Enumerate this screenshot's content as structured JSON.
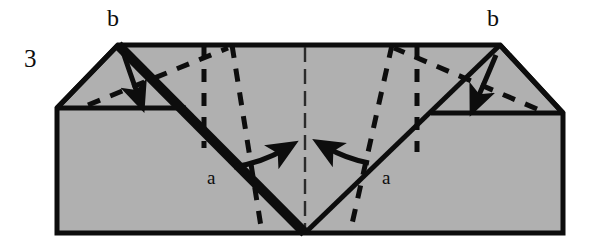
{
  "figure": {
    "name": "beveled-block-fold-diagram",
    "index_label": "3",
    "background_color": "#ffffff",
    "body_fill_color": "#b0b0b0",
    "outline_color": "#0d0d0d",
    "labels": [
      {
        "id": "index",
        "text": "3",
        "x": 24,
        "y": 46
      },
      {
        "id": "b-left",
        "text": "b",
        "x": 107,
        "y": 6
      },
      {
        "id": "b-right",
        "text": "b",
        "x": 487,
        "y": 6
      },
      {
        "id": "a-left",
        "text": "a",
        "x": 207,
        "y": 168
      },
      {
        "id": "a-right",
        "text": "a",
        "x": 382,
        "y": 168
      }
    ],
    "geometry": {
      "outline_points": "57,233 57,108 118,45 500,45 563,113 563,233",
      "body_top_left": "57,108",
      "body_top_right": "563,113",
      "apex_left": "118,45",
      "apex_right": "500,45",
      "valley_bottom": "305,233",
      "left_bevel_edge": "57,108 118,45",
      "right_bevel_edge": "500,45 563,113",
      "left_facet_base": "57,108 185,108",
      "right_facet_base": "432,113 563,113",
      "heavy_fold_left": "118,45 305,233",
      "fold_right": "500,45 305,233",
      "center_axis": "305,45 305,233"
    },
    "strokes": {
      "outline_width": 5,
      "heavy_fold_width": 9,
      "fold_width": 5,
      "dash_width": 5,
      "arrow_width": 5,
      "dash_pattern": "13 11"
    },
    "elements": [
      {
        "id": "block-outline",
        "type": "polygon"
      },
      {
        "id": "left-bevel-facet",
        "type": "triangle-facet"
      },
      {
        "id": "right-bevel-facet",
        "type": "triangle-facet"
      },
      {
        "id": "left-fold-line-heavy",
        "type": "solid-line"
      },
      {
        "id": "right-fold-line",
        "type": "solid-line"
      },
      {
        "id": "center-dash-dot-axis",
        "type": "dashed-line"
      },
      {
        "id": "dashed-crease-left-outer",
        "type": "dashed-line"
      },
      {
        "id": "dashed-crease-left-inner",
        "type": "dashed-line"
      },
      {
        "id": "dashed-crease-right-outer",
        "type": "dashed-line"
      },
      {
        "id": "dashed-crease-right-inner",
        "type": "dashed-line"
      },
      {
        "id": "dashed-diagonal-left",
        "type": "dashed-line"
      },
      {
        "id": "dashed-diagonal-right",
        "type": "dashed-line"
      },
      {
        "id": "arrow-left-facet-down",
        "type": "curved-arrow"
      },
      {
        "id": "arrow-right-facet-down",
        "type": "curved-arrow"
      },
      {
        "id": "arrow-center-left-inward",
        "type": "curved-arrow"
      },
      {
        "id": "arrow-center-right-inward",
        "type": "curved-arrow"
      }
    ]
  }
}
